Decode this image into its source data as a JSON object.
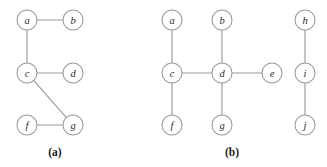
{
  "figure": {
    "width": 327,
    "height": 167,
    "background_color": "#ffffff",
    "edge_color": "#9a9a9a",
    "node_fill_color": "#ffffff",
    "node_stroke_color": "#9a9a9a",
    "label_color": "#2b2b2b",
    "node_radius": 10
  },
  "panels": [
    {
      "id": "panel-a",
      "caption": "(a)",
      "caption_x": 55,
      "caption_y": 152,
      "nodes": [
        {
          "id": "a",
          "label": "a",
          "x": 27,
          "y": 20
        },
        {
          "id": "b",
          "label": "b",
          "x": 73,
          "y": 20
        },
        {
          "id": "c",
          "label": "c",
          "x": 27,
          "y": 73
        },
        {
          "id": "d",
          "label": "d",
          "x": 73,
          "y": 73
        },
        {
          "id": "f",
          "label": "f",
          "x": 27,
          "y": 125
        },
        {
          "id": "g",
          "label": "g",
          "x": 73,
          "y": 125
        }
      ],
      "edges": [
        {
          "from": "a",
          "to": "b"
        },
        {
          "from": "a",
          "to": "c"
        },
        {
          "from": "c",
          "to": "d"
        },
        {
          "from": "c",
          "to": "g"
        },
        {
          "from": "f",
          "to": "g"
        }
      ]
    },
    {
      "id": "panel-b",
      "caption": "(b)",
      "caption_x": 232,
      "caption_y": 152,
      "nodes": [
        {
          "id": "a",
          "label": "a",
          "x": 172,
          "y": 20
        },
        {
          "id": "b",
          "label": "b",
          "x": 222,
          "y": 20
        },
        {
          "id": "h",
          "label": "h",
          "x": 305,
          "y": 20
        },
        {
          "id": "c",
          "label": "c",
          "x": 172,
          "y": 73
        },
        {
          "id": "d",
          "label": "d",
          "x": 222,
          "y": 73
        },
        {
          "id": "e",
          "label": "e",
          "x": 272,
          "y": 73
        },
        {
          "id": "i",
          "label": "i",
          "x": 305,
          "y": 73
        },
        {
          "id": "f",
          "label": "f",
          "x": 172,
          "y": 125
        },
        {
          "id": "g",
          "label": "g",
          "x": 222,
          "y": 125
        },
        {
          "id": "j",
          "label": "j",
          "x": 305,
          "y": 125
        }
      ],
      "edges": [
        {
          "from": "a",
          "to": "c"
        },
        {
          "from": "b",
          "to": "d"
        },
        {
          "from": "c",
          "to": "d"
        },
        {
          "from": "d",
          "to": "e"
        },
        {
          "from": "c",
          "to": "f"
        },
        {
          "from": "d",
          "to": "g"
        },
        {
          "from": "h",
          "to": "i"
        },
        {
          "from": "i",
          "to": "j"
        }
      ]
    }
  ]
}
